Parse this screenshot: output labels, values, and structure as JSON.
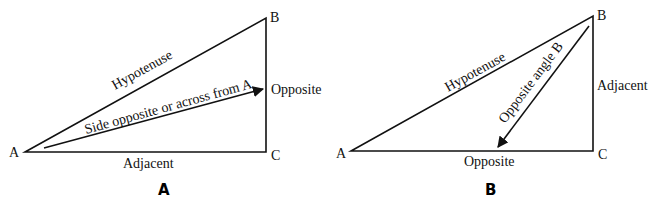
{
  "panels": [
    {
      "id": "A",
      "label": "A",
      "vertices": {
        "A": "A",
        "B": "B",
        "C": "C"
      },
      "sides": {
        "hypotenuse": "Hypotenuse",
        "adjacent": "Adjacent",
        "opposite": "Opposite"
      },
      "arrow_label": "Side opposite or across from A"
    },
    {
      "id": "B",
      "label": "B",
      "vertices": {
        "A": "A",
        "B": "B",
        "C": "C"
      },
      "sides": {
        "hypotenuse": "Hypotenuse",
        "adjacent": "Adjacent",
        "opposite": "Opposite"
      },
      "arrow_label": "Opposite angle B"
    }
  ],
  "colors": {
    "line": "#111111",
    "background": "#ffffff"
  }
}
